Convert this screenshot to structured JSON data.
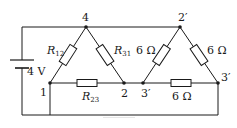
{
  "diagram": {
    "type": "circuit",
    "source": {
      "label": "4 V",
      "voltage_V": 4
    },
    "nodes": [
      {
        "id": "4",
        "label": "4"
      },
      {
        "id": "2p",
        "label": "2′"
      },
      {
        "id": "1",
        "label": "1"
      },
      {
        "id": "2",
        "label": "2"
      },
      {
        "id": "3p_left",
        "label": "3′"
      },
      {
        "id": "3p_right",
        "label": "3′"
      }
    ],
    "resistors": [
      {
        "id": "R12",
        "symbol": "R",
        "subscript": "12",
        "between": [
          "4",
          "1"
        ]
      },
      {
        "id": "R31",
        "symbol": "R",
        "subscript": "31",
        "between": [
          "4",
          "2"
        ]
      },
      {
        "id": "R23",
        "symbol": "R",
        "subscript": "23",
        "between": [
          "1",
          "2"
        ]
      },
      {
        "id": "R_2p_3pL",
        "label": "6 Ω",
        "between": [
          "2′",
          "3′"
        ]
      },
      {
        "id": "R_2p_3pR",
        "label": "6 Ω",
        "between": [
          "2′",
          "3′"
        ]
      },
      {
        "id": "R_3p_3p",
        "label": "6 Ω",
        "between": [
          "3′",
          "3′"
        ]
      }
    ],
    "labels": {
      "n4": "4",
      "n2p": "2′",
      "n1": "1",
      "n2": "2",
      "n3pl": "3′",
      "n3pr": "3′",
      "voltage": "4 V",
      "r12_sym": "R",
      "r12_sub": "12",
      "r31_sym": "R",
      "r31_sub": "31",
      "r23_sym": "R",
      "r23_sub": "23",
      "r6a": "6 Ω",
      "r6b": "6 Ω",
      "r6c": "6 Ω"
    }
  },
  "colors": {
    "stroke": "#1a1a1a",
    "fill": "#ffffff"
  }
}
